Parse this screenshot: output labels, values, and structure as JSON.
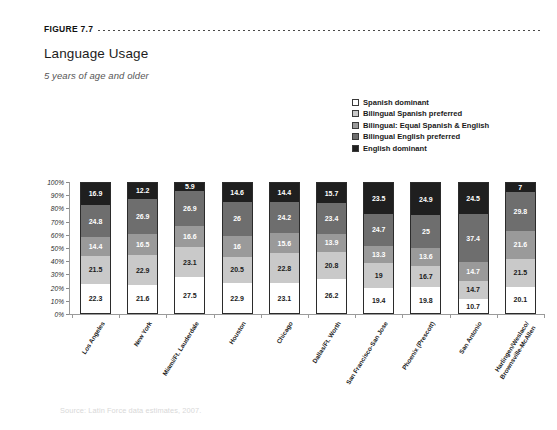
{
  "figure": {
    "label": "FIGURE 7.7",
    "title": "Language Usage",
    "subtitle": "5 years of age and older",
    "source": "Source: Latin Force data estimates, 2007."
  },
  "legend": {
    "items": [
      {
        "label": "Spanish dominant",
        "color": "#ffffff"
      },
      {
        "label": "Bilingual Spanish preferred",
        "color": "#c9c9c9"
      },
      {
        "label": "Bilingual: Equal Spanish & English",
        "color": "#9a9a9a"
      },
      {
        "label": "Bilingual English preferred",
        "color": "#6e6e6e"
      },
      {
        "label": "English dominant",
        "color": "#1f1f1f"
      }
    ]
  },
  "chart_data": {
    "type": "bar",
    "stacked": true,
    "stack_total": 100,
    "title": "Language Usage",
    "subtitle": "5 years of age and older",
    "xlabel": "",
    "ylabel": "",
    "ylim": [
      0,
      100
    ],
    "yticks": [
      "0%",
      "10%",
      "20%",
      "30%",
      "40%",
      "50%",
      "60%",
      "70%",
      "80%",
      "90%",
      "100%"
    ],
    "grid": false,
    "legend_position": "top-right",
    "categories": [
      "Los Angeles",
      "New York",
      "Miami/Ft. Lauderdale",
      "Houston",
      "Chicago",
      "Dallas/Ft. Worth",
      "San Francisco-San Jose",
      "Phoenix (Prescott)",
      "San Antonio",
      "Harlingen/Weslaco/Brownsville-McAllen"
    ],
    "category_lines": [
      [
        "Los Angeles"
      ],
      [
        "New York"
      ],
      [
        "Miami/Ft. Lauderdale"
      ],
      [
        "Houston"
      ],
      [
        "Chicago"
      ],
      [
        "Dallas/Ft. Worth"
      ],
      [
        "San Francisco-San Jose"
      ],
      [
        "Phoenix (Prescott)"
      ],
      [
        "San Antonio"
      ],
      [
        "Harlingen/Weslaco/",
        "Brownsville-McAllen"
      ]
    ],
    "series": [
      {
        "name": "Spanish dominant",
        "color": "#ffffff",
        "text_color": "#1a1a1a",
        "values": [
          22.3,
          21.6,
          27.5,
          22.9,
          23.1,
          26.2,
          19.4,
          19.8,
          10.7,
          20.1
        ]
      },
      {
        "name": "Bilingual Spanish preferred",
        "color": "#c9c9c9",
        "text_color": "#1a1a1a",
        "values": [
          21.5,
          22.9,
          23.1,
          20.5,
          22.8,
          20.8,
          19,
          16.7,
          14.7,
          21.5
        ]
      },
      {
        "name": "Bilingual: Equal Spanish & English",
        "color": "#9a9a9a",
        "text_color": "#ffffff",
        "values": [
          14.4,
          16.5,
          16.6,
          16,
          15.6,
          13.9,
          13.3,
          13.6,
          14.7,
          21.6
        ]
      },
      {
        "name": "Bilingual English preferred",
        "color": "#6e6e6e",
        "text_color": "#ffffff",
        "values": [
          24.8,
          26.9,
          26.9,
          26,
          24.2,
          23.4,
          24.7,
          25,
          37.4,
          29.8
        ]
      },
      {
        "name": "English dominant",
        "color": "#1f1f1f",
        "text_color": "#ffffff",
        "values": [
          16.9,
          12.2,
          5.9,
          14.6,
          14.4,
          15.7,
          23.5,
          24.9,
          24.5,
          7
        ]
      }
    ]
  }
}
